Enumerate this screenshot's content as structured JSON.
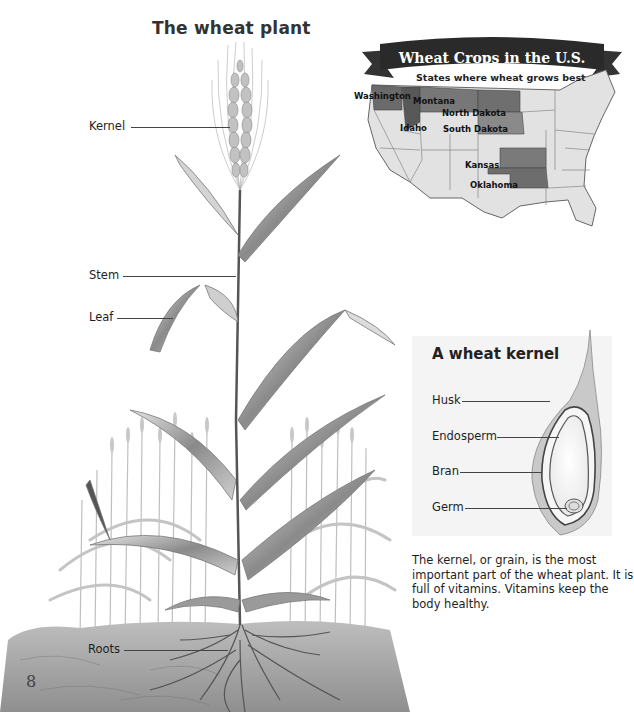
{
  "plant_diagram": {
    "title": "The wheat plant",
    "labels": [
      {
        "id": "kernel",
        "text": "Kernel"
      },
      {
        "id": "stem",
        "text": "Stem"
      },
      {
        "id": "leaf",
        "text": "Leaf"
      },
      {
        "id": "roots",
        "text": "Roots"
      }
    ]
  },
  "map": {
    "banner_title": "Wheat Crops in the U.S.",
    "subtitle": "States where wheat grows best",
    "states": [
      "Washington",
      "Montana",
      "North Dakota",
      "Idaho",
      "South Dakota",
      "Kansas",
      "Oklahoma"
    ],
    "highlight_color": "#6a6a6a",
    "base_color": "#e4e4e4"
  },
  "kernel_diagram": {
    "title": "A wheat kernel",
    "labels": [
      {
        "id": "husk",
        "text": "Husk"
      },
      {
        "id": "endosperm",
        "text": "Endosperm"
      },
      {
        "id": "bran",
        "text": "Bran"
      },
      {
        "id": "germ",
        "text": "Germ"
      }
    ],
    "caption": "The kernel, or grain, is the most important part of the wheat plant. It is full of vitamins. Vitamins keep the body healthy."
  },
  "page": {
    "number": "8"
  }
}
